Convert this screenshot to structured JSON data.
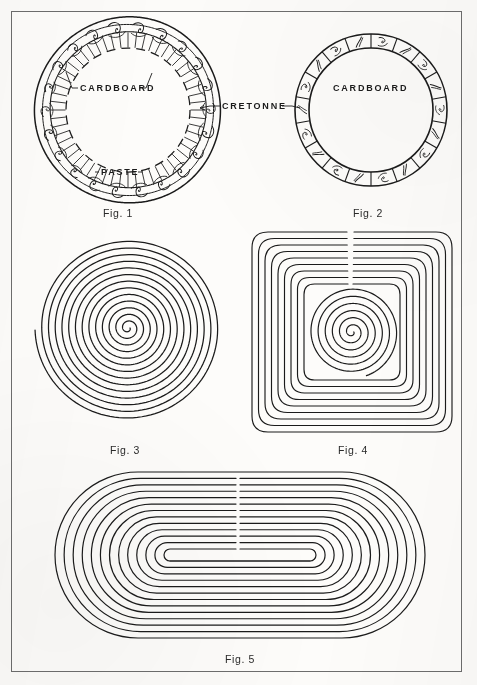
{
  "page": {
    "background_color": "#fcfbf9",
    "ink_color": "#1b1b1b",
    "frame_color": "#6d6d6d",
    "width": 477,
    "height": 685
  },
  "figures": [
    {
      "id": "fig1",
      "label": "Fig. 1",
      "label_x": 103,
      "label_y": 207,
      "type": "decorated-ring-with-hatching",
      "center_x": 128,
      "center_y": 110,
      "outer_radius": 93,
      "inner_radius": 62,
      "callouts": [
        {
          "name": "cardboard",
          "text": "CARDBOARD",
          "x": 80,
          "y": 83
        },
        {
          "name": "paste",
          "text": "PASTE",
          "x": 101,
          "y": 167
        }
      ]
    },
    {
      "id": "fig2",
      "label": "Fig. 2",
      "label_x": 353,
      "label_y": 207,
      "type": "segmented-decorated-ring",
      "center_x": 371,
      "center_y": 110,
      "outer_radius": 76,
      "inner_radius": 62,
      "segments": 18,
      "callouts": [
        {
          "name": "cardboard",
          "text": "CARDBOARD",
          "x": 333,
          "y": 83
        }
      ]
    },
    {
      "id": "fig3",
      "label": "Fig. 3",
      "label_x": 110,
      "label_y": 444,
      "type": "round-spiral",
      "center_x": 128,
      "center_y": 328,
      "outer_radius": 93,
      "turns": 13.5
    },
    {
      "id": "fig4",
      "label": "Fig. 4",
      "label_x": 338,
      "label_y": 444,
      "type": "square-spiral",
      "center_x": 352,
      "center_y": 332,
      "half_size": 100,
      "turns": 9
    },
    {
      "id": "fig5",
      "label": "Fig. 5",
      "label_x": 225,
      "label_y": 653,
      "type": "oblong-spiral",
      "center_x": 240,
      "center_y": 555,
      "half_width": 185,
      "half_height": 83,
      "turns": 13
    }
  ],
  "shared_callouts": [
    {
      "name": "cretonne",
      "text": "CRETONNE",
      "x": 222,
      "y": 101
    }
  ]
}
